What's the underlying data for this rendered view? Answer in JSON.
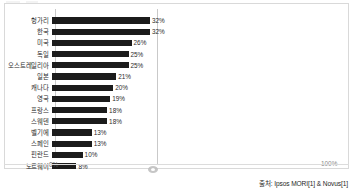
{
  "chart_data": {
    "type": "bar",
    "orientation": "horizontal",
    "title": "",
    "subtitle": "",
    "xlabel": "",
    "ylabel": "",
    "xlim": [
      0,
      100
    ],
    "grid": false,
    "legend": null,
    "value_suffix": "%",
    "categories": [
      "헝가리",
      "한국",
      "미국",
      "독일",
      "오스트레일리아",
      "일본",
      "캐나다",
      "영국",
      "프랑스",
      "스웨덴",
      "벨기에",
      "스페인",
      "핀란드",
      "노르웨이"
    ],
    "values": [
      32,
      32,
      26,
      25,
      25,
      21,
      20,
      19,
      18,
      18,
      13,
      13,
      10,
      8
    ],
    "data_labels": [
      "32%",
      "32%",
      "26%",
      "25%",
      "25%",
      "21%",
      "20%",
      "19%",
      "18%",
      "18%",
      "13%",
      "13%",
      "10%",
      "8%"
    ],
    "xticks": [
      0,
      100
    ],
    "xtick_labels": [
      "0%",
      "100%"
    ],
    "bar_color": "#1b1b1b",
    "axis_color": "#c9c9c9"
  },
  "axis": {
    "x_min_label": "0%",
    "x_max_label": "100%"
  },
  "footer": {
    "source": "출처: Ipsos MORI[1] & Novus[1]"
  }
}
